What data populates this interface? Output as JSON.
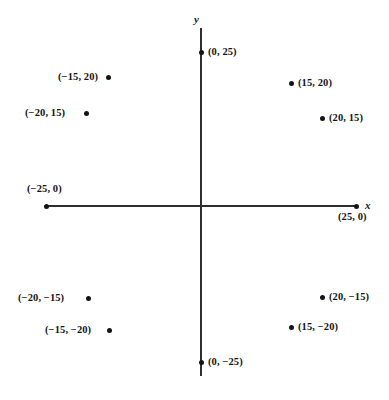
{
  "figure": {
    "type": "coordinate-plane-scatter",
    "background_color": "#ffffff",
    "axis_color": "#2e2e2e",
    "point_color": "#141414",
    "width": 389,
    "height": 400
  },
  "axes": {
    "x_axis_label": "x",
    "y_axis_label": "y",
    "origin_px": {
      "x": 201,
      "y": 206
    },
    "x_axis_px": {
      "left": 45,
      "right": 357,
      "y": 206
    },
    "y_axis_px": {
      "top": 28,
      "bottom": 376,
      "x": 201
    },
    "x_label_px": {
      "x": 365,
      "y": 200
    },
    "y_label_px": {
      "x": 194,
      "y": 14
    }
  },
  "chart_data": {
    "type": "scatter",
    "title": "",
    "xlabel": "x",
    "ylabel": "y",
    "grid": false,
    "legend": false,
    "xlim": [
      -25,
      25
    ],
    "ylim": [
      -25,
      25
    ],
    "points": [
      {
        "label": "(0, 25)",
        "x": 0,
        "y": 25,
        "px": 201,
        "py": 52,
        "label_px": 208,
        "label_py": 47,
        "align": "right-of-dot"
      },
      {
        "label": "(−15, 20)",
        "x": -15,
        "y": 20,
        "px": 108,
        "py": 77,
        "label_px": 58,
        "label_py": 72,
        "align": "left-of-dot"
      },
      {
        "label": "(15, 20)",
        "x": 15,
        "y": 20,
        "px": 291,
        "py": 83,
        "label_px": 298,
        "label_py": 78,
        "align": "right-of-dot"
      },
      {
        "label": "(−20, 15)",
        "x": -20,
        "y": 15,
        "px": 86,
        "py": 113,
        "label_px": 25,
        "label_py": 108,
        "align": "left-of-dot"
      },
      {
        "label": "(20, 15)",
        "x": 20,
        "y": 15,
        "px": 322,
        "py": 118,
        "label_px": 329,
        "label_py": 113,
        "align": "right-of-dot"
      },
      {
        "label": "(−25, 0)",
        "x": -25,
        "y": 0,
        "px": 46,
        "py": 206,
        "label_px": 27,
        "label_py": 184,
        "align": "above-dot"
      },
      {
        "label": "(25, 0)",
        "x": 25,
        "y": 0,
        "px": 356,
        "py": 206,
        "label_px": 338,
        "label_py": 212,
        "align": "below-dot"
      },
      {
        "label": "(−20, −15)",
        "x": -20,
        "y": -15,
        "px": 88,
        "py": 298,
        "label_px": 18,
        "label_py": 293,
        "align": "left-of-dot"
      },
      {
        "label": "(20, −15)",
        "x": 20,
        "y": -15,
        "px": 322,
        "py": 297,
        "label_px": 329,
        "label_py": 292,
        "align": "right-of-dot"
      },
      {
        "label": "(−15, −20)",
        "x": -15,
        "y": -20,
        "px": 109,
        "py": 330,
        "label_px": 45,
        "label_py": 325,
        "align": "left-of-dot"
      },
      {
        "label": "(15, −20)",
        "x": 15,
        "y": -20,
        "px": 291,
        "py": 327,
        "label_px": 298,
        "label_py": 322,
        "align": "right-of-dot"
      },
      {
        "label": "(0, −25)",
        "x": 0,
        "y": -25,
        "px": 201,
        "py": 362,
        "label_px": 208,
        "label_py": 357,
        "align": "right-of-dot"
      }
    ]
  }
}
